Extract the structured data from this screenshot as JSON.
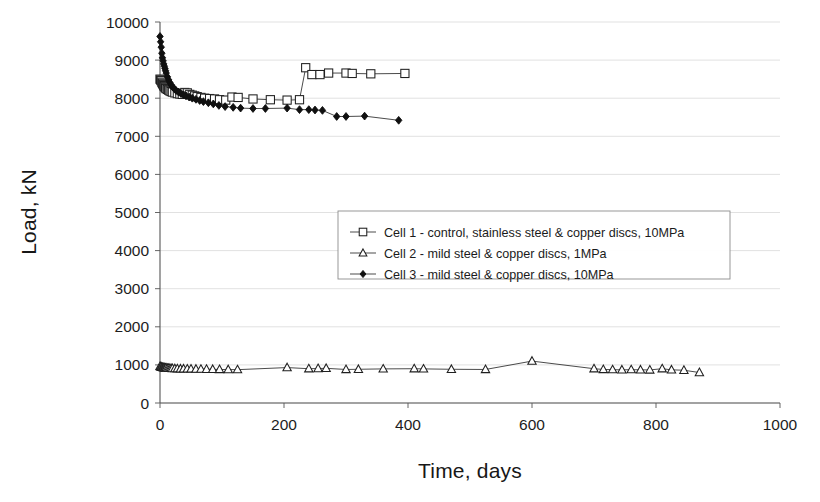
{
  "chart_data": {
    "type": "scatter",
    "title": "",
    "xlabel": "Time, days",
    "ylabel": "Load, kN",
    "xlim": [
      0,
      1000
    ],
    "ylim": [
      0,
      10000
    ],
    "xticks": [
      0,
      200,
      400,
      600,
      800,
      1000
    ],
    "yticks": [
      0,
      1000,
      2000,
      3000,
      4000,
      5000,
      6000,
      7000,
      8000,
      9000,
      10000
    ],
    "grid": true,
    "legend_position": "center-right",
    "series": [
      {
        "name": "Cell 1 - control, stainless steel & copper discs, 10MPa",
        "marker": "open-square",
        "points": [
          [
            0,
            8500
          ],
          [
            1,
            8480
          ],
          [
            2,
            8460
          ],
          [
            3,
            8420
          ],
          [
            4,
            8390
          ],
          [
            5,
            8360
          ],
          [
            6,
            8330
          ],
          [
            7,
            8310
          ],
          [
            8,
            8290
          ],
          [
            9,
            8270
          ],
          [
            10,
            8250
          ],
          [
            12,
            8230
          ],
          [
            14,
            8210
          ],
          [
            16,
            8190
          ],
          [
            18,
            8175
          ],
          [
            20,
            8160
          ],
          [
            24,
            8140
          ],
          [
            28,
            8120
          ],
          [
            32,
            8110
          ],
          [
            36,
            8100
          ],
          [
            40,
            8150
          ],
          [
            44,
            8140
          ],
          [
            48,
            8100
          ],
          [
            52,
            8080
          ],
          [
            56,
            8060
          ],
          [
            60,
            8040
          ],
          [
            66,
            8020
          ],
          [
            72,
            8000
          ],
          [
            80,
            7990
          ],
          [
            88,
            7980
          ],
          [
            96,
            7960
          ],
          [
            106,
            7950
          ],
          [
            116,
            8030
          ],
          [
            126,
            8020
          ],
          [
            150,
            7980
          ],
          [
            178,
            7960
          ],
          [
            205,
            7950
          ],
          [
            225,
            7960
          ],
          [
            235,
            8800
          ],
          [
            245,
            8620
          ],
          [
            258,
            8620
          ],
          [
            272,
            8660
          ],
          [
            300,
            8660
          ],
          [
            310,
            8650
          ],
          [
            340,
            8640
          ],
          [
            395,
            8650
          ]
        ]
      },
      {
        "name": "Cell 2 - mild steel & copper discs, 1MPa",
        "marker": "open-triangle",
        "points": [
          [
            0,
            960
          ],
          [
            1,
            950
          ],
          [
            2,
            945
          ],
          [
            3,
            940
          ],
          [
            4,
            935
          ],
          [
            5,
            930
          ],
          [
            6,
            928
          ],
          [
            7,
            925
          ],
          [
            8,
            922
          ],
          [
            9,
            920
          ],
          [
            10,
            918
          ],
          [
            12,
            915
          ],
          [
            14,
            912
          ],
          [
            16,
            910
          ],
          [
            18,
            908
          ],
          [
            20,
            906
          ],
          [
            24,
            903
          ],
          [
            28,
            900
          ],
          [
            33,
            898
          ],
          [
            38,
            896
          ],
          [
            44,
            895
          ],
          [
            50,
            893
          ],
          [
            58,
            890
          ],
          [
            66,
            888
          ],
          [
            75,
            886
          ],
          [
            85,
            883
          ],
          [
            96,
            880
          ],
          [
            110,
            878
          ],
          [
            125,
            875
          ],
          [
            205,
            930
          ],
          [
            240,
            900
          ],
          [
            255,
            905
          ],
          [
            268,
            910
          ],
          [
            300,
            880
          ],
          [
            320,
            885
          ],
          [
            360,
            895
          ],
          [
            410,
            900
          ],
          [
            425,
            895
          ],
          [
            470,
            885
          ],
          [
            525,
            880
          ],
          [
            600,
            1100
          ],
          [
            700,
            900
          ],
          [
            715,
            880
          ],
          [
            730,
            875
          ],
          [
            745,
            870
          ],
          [
            760,
            875
          ],
          [
            775,
            870
          ],
          [
            790,
            868
          ],
          [
            810,
            900
          ],
          [
            825,
            870
          ],
          [
            845,
            860
          ],
          [
            870,
            800
          ]
        ]
      },
      {
        "name": "Cell 3 - mild steel & copper discs, 10MPa",
        "marker": "filled-diamond",
        "points": [
          [
            0,
            9620
          ],
          [
            1,
            9480
          ],
          [
            2,
            9340
          ],
          [
            3,
            9180
          ],
          [
            4,
            9060
          ],
          [
            5,
            8980
          ],
          [
            6,
            8900
          ],
          [
            7,
            8840
          ],
          [
            8,
            8780
          ],
          [
            9,
            8720
          ],
          [
            10,
            8660
          ],
          [
            12,
            8560
          ],
          [
            14,
            8480
          ],
          [
            16,
            8410
          ],
          [
            18,
            8350
          ],
          [
            20,
            8300
          ],
          [
            23,
            8250
          ],
          [
            26,
            8200
          ],
          [
            30,
            8160
          ],
          [
            34,
            8120
          ],
          [
            38,
            8090
          ],
          [
            42,
            8060
          ],
          [
            47,
            8030
          ],
          [
            52,
            8000
          ],
          [
            58,
            7970
          ],
          [
            64,
            7940
          ],
          [
            70,
            7910
          ],
          [
            78,
            7880
          ],
          [
            86,
            7850
          ],
          [
            95,
            7810
          ],
          [
            105,
            7780
          ],
          [
            118,
            7760
          ],
          [
            130,
            7740
          ],
          [
            150,
            7730
          ],
          [
            170,
            7730
          ],
          [
            205,
            7740
          ],
          [
            225,
            7700
          ],
          [
            240,
            7700
          ],
          [
            250,
            7690
          ],
          [
            262,
            7680
          ],
          [
            285,
            7520
          ],
          [
            300,
            7520
          ],
          [
            330,
            7530
          ],
          [
            385,
            7420
          ]
        ]
      }
    ]
  },
  "legend": {
    "entries": [
      {
        "label": "Cell 1 - control, stainless steel & copper discs, 10MPa",
        "marker": "open-square"
      },
      {
        "label": "Cell 2 - mild steel & copper discs, 1MPa",
        "marker": "open-triangle"
      },
      {
        "label": "Cell 3 - mild steel & copper discs, 10MPa",
        "marker": "filled-diamond"
      }
    ]
  },
  "axes": {
    "x_title": "Time, days",
    "y_title": "Load, kN",
    "x_tick_labels": [
      "0",
      "200",
      "400",
      "600",
      "800",
      "1000"
    ],
    "y_tick_labels": [
      "0",
      "1000",
      "2000",
      "3000",
      "4000",
      "5000",
      "6000",
      "7000",
      "8000",
      "9000",
      "10000"
    ]
  },
  "colors": {
    "marker_stroke": "#1f1f1f",
    "marker_fill_open": "#ffffff",
    "marker_fill_solid": "#101010",
    "line": "#2b2b2b",
    "grid": "#d9d9d9",
    "axis": "#555555",
    "background": "#ffffff"
  }
}
